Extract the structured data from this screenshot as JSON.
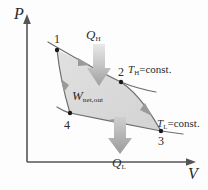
{
  "figure": {
    "type": "pv-diagram",
    "width": 208,
    "height": 190,
    "background": "#fdfdfd"
  },
  "axes": {
    "y_label": "P",
    "x_label": "V",
    "color": "#555555",
    "origin": {
      "x": 27,
      "y": 162
    },
    "y_top": {
      "x": 27,
      "y": 16
    },
    "x_right": {
      "x": 196,
      "y": 162
    }
  },
  "states": [
    {
      "name": "1",
      "x": 57,
      "y": 50
    },
    {
      "name": "2",
      "x": 121,
      "y": 82
    },
    {
      "name": "3",
      "x": 161,
      "y": 131
    },
    {
      "name": "4",
      "x": 70,
      "y": 113
    }
  ],
  "processes": [
    {
      "id": "1-2",
      "kind": "isothermal-expansion",
      "label": "T_H = const."
    },
    {
      "id": "2-3",
      "kind": "adiabatic-expansion",
      "label": ""
    },
    {
      "id": "3-4",
      "kind": "isothermal-compression",
      "label": "T_L = const."
    },
    {
      "id": "4-1",
      "kind": "adiabatic-compression",
      "label": ""
    }
  ],
  "labels": {
    "q_high": {
      "symbol": "Q",
      "subscript": "H",
      "text": "Q_H"
    },
    "q_low": {
      "symbol": "Q",
      "subscript": "L",
      "text": "Q_L"
    },
    "work": {
      "symbol": "W",
      "subscript": "net,out",
      "text": "W_net,out"
    },
    "iso_high": {
      "symbol": "T",
      "subscript": "H",
      "suffix": "=const.",
      "text": "T_H=const."
    },
    "iso_low": {
      "symbol": "T",
      "subscript": "L",
      "suffix": "=const.",
      "text": "T_L=const."
    }
  },
  "colors": {
    "axis": "#555555",
    "curve": "#6e6e6e",
    "fill": "#d9d9d9",
    "arrow_gray": "#b4b4b4",
    "point": "#1a1a1a",
    "text": "#2b2b2b"
  }
}
